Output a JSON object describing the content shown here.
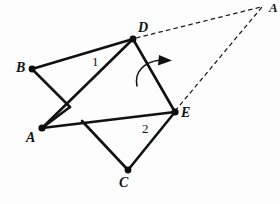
{
  "figure": {
    "type": "geometry-diagram",
    "canvas": {
      "width": 280,
      "height": 204,
      "background": "#fdfdfd"
    },
    "style": {
      "solid_stroke": "#111111",
      "dashed_stroke": "#1a1a1a",
      "vertex_fill": "#0c0c0c",
      "label_color": "#121212"
    },
    "points": [
      {
        "id": "B",
        "label": "B",
        "x": 32,
        "y": 69,
        "dot": true,
        "label_x": 16,
        "label_y": 61
      },
      {
        "id": "D",
        "label": "D",
        "x": 133,
        "y": 39,
        "dot": true,
        "label_x": 138,
        "label_y": 21
      },
      {
        "id": "A",
        "label": "A",
        "x": 42,
        "y": 128,
        "dot": true,
        "label_x": 26,
        "label_y": 131
      },
      {
        "id": "E",
        "label": "E",
        "x": 175,
        "y": 112,
        "dot": true,
        "label_x": 181,
        "label_y": 106
      },
      {
        "id": "C",
        "label": "C",
        "x": 128,
        "y": 170,
        "dot": true,
        "label_x": 119,
        "label_y": 176
      },
      {
        "id": "Aprime",
        "label": "A",
        "x": 263,
        "y": 6,
        "dot": false,
        "label_x": 268,
        "label_y": 0
      },
      {
        "id": "K",
        "label": "",
        "x": 70,
        "y": 107,
        "dot": false,
        "label_x": 0,
        "label_y": 0
      },
      {
        "id": "M",
        "label": "",
        "x": 82,
        "y": 121,
        "dot": false,
        "label_x": 0,
        "label_y": 0
      }
    ],
    "solid_edges": [
      {
        "name": "edge-B-D",
        "from": "B",
        "to": "D"
      },
      {
        "name": "edge-B-K",
        "from": "B",
        "to": "K"
      },
      {
        "name": "edge-K-A",
        "from": "K",
        "to": "A"
      },
      {
        "name": "edge-A-D",
        "from": "A",
        "to": "D"
      },
      {
        "name": "edge-D-E",
        "from": "D",
        "to": "E"
      },
      {
        "name": "edge-A-E",
        "from": "A",
        "to": "E"
      },
      {
        "name": "edge-M-C",
        "from": "M",
        "to": "C"
      },
      {
        "name": "edge-C-E",
        "from": "C",
        "to": "E"
      }
    ],
    "dashed_edges": [
      {
        "name": "dashed-D-Aprime",
        "from": "D",
        "to": "Aprime"
      },
      {
        "name": "dashed-E-Aprime",
        "from": "E",
        "to": "Aprime"
      }
    ],
    "angle_labels": [
      {
        "id": "angle-1",
        "text": "1",
        "x": 92,
        "y": 55
      },
      {
        "id": "angle-2",
        "text": "2",
        "x": 142,
        "y": 122
      }
    ],
    "rotation_arrow": {
      "name": "rotation-arrow",
      "path": "M 137 86 C 134 72 144 62 160 60",
      "head": "160,55 172,60.5 159,65.5"
    }
  }
}
